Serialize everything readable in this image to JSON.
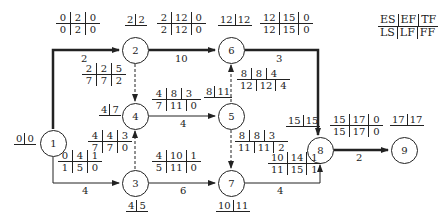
{
  "legend": {
    "top": [
      "ES",
      "EF",
      "TF"
    ],
    "bottom": [
      "LS",
      "LF",
      "FF"
    ]
  },
  "nodes": [
    {
      "id": "1",
      "label": "1",
      "et": [
        "0",
        "0"
      ]
    },
    {
      "id": "2",
      "label": "2",
      "et": [
        "2",
        "2"
      ]
    },
    {
      "id": "3",
      "label": "3",
      "et": [
        "4",
        "5"
      ]
    },
    {
      "id": "4",
      "label": "4",
      "et": [
        "4",
        "7"
      ]
    },
    {
      "id": "5",
      "label": "5",
      "et": [
        "8",
        "11"
      ]
    },
    {
      "id": "6",
      "label": "6",
      "et": [
        "12",
        "12"
      ]
    },
    {
      "id": "7",
      "label": "7",
      "et": [
        "10",
        "11"
      ]
    },
    {
      "id": "8",
      "label": "8",
      "et": [
        "15",
        "15"
      ]
    },
    {
      "id": "9",
      "label": "9",
      "et": [
        "17",
        "17"
      ]
    }
  ],
  "activities": [
    {
      "from": "1",
      "to": "2",
      "duration": "2",
      "critical": true,
      "dummy": false,
      "params": {
        "top": [
          "0",
          "2",
          "0"
        ],
        "bottom": [
          "0",
          "2",
          "0"
        ]
      }
    },
    {
      "from": "1",
      "to": "3",
      "duration": "4",
      "critical": false,
      "dummy": false,
      "params": {
        "top": [
          "0",
          "4",
          "1"
        ],
        "bottom": [
          "1",
          "5",
          "0"
        ]
      }
    },
    {
      "from": "2",
      "to": "6",
      "duration": "10",
      "critical": true,
      "dummy": false,
      "params": {
        "top": [
          "2",
          "12",
          "0"
        ],
        "bottom": [
          "2",
          "12",
          "0"
        ]
      }
    },
    {
      "from": "2",
      "to": "4",
      "duration": "",
      "critical": false,
      "dummy": true,
      "params": {
        "top": [
          "2",
          "2",
          "5"
        ],
        "bottom": [
          "7",
          "7",
          "2"
        ]
      }
    },
    {
      "from": "3",
      "to": "4",
      "duration": "",
      "critical": false,
      "dummy": true,
      "params": {
        "top": [
          "4",
          "4",
          "3"
        ],
        "bottom": [
          "7",
          "7",
          "0"
        ]
      }
    },
    {
      "from": "3",
      "to": "7",
      "duration": "6",
      "critical": false,
      "dummy": false,
      "params": {
        "top": [
          "4",
          "10",
          "1"
        ],
        "bottom": [
          "5",
          "11",
          "0"
        ]
      }
    },
    {
      "from": "4",
      "to": "5",
      "duration": "4",
      "critical": false,
      "dummy": false,
      "params": {
        "top": [
          "4",
          "8",
          "3"
        ],
        "bottom": [
          "7",
          "11",
          "0"
        ]
      }
    },
    {
      "from": "5",
      "to": "6",
      "duration": "",
      "critical": false,
      "dummy": true,
      "params": {
        "top": [
          "8",
          "8",
          "4"
        ],
        "bottom": [
          "12",
          "12",
          "4"
        ]
      }
    },
    {
      "from": "5",
      "to": "7",
      "duration": "",
      "critical": false,
      "dummy": true,
      "params": {
        "top": [
          "8",
          "8",
          "3"
        ],
        "bottom": [
          "11",
          "11",
          "2"
        ]
      }
    },
    {
      "from": "6",
      "to": "8",
      "duration": "3",
      "critical": true,
      "dummy": false,
      "params": {
        "top": [
          "12",
          "15",
          "0"
        ],
        "bottom": [
          "12",
          "15",
          "0"
        ]
      }
    },
    {
      "from": "7",
      "to": "8",
      "duration": "4",
      "critical": false,
      "dummy": false,
      "params": {
        "top": [
          "10",
          "14",
          "1"
        ],
        "bottom": [
          "11",
          "15",
          "1"
        ]
      }
    },
    {
      "from": "8",
      "to": "9",
      "duration": "2",
      "critical": true,
      "dummy": false,
      "params": {
        "top": [
          "15",
          "17",
          "0"
        ],
        "bottom": [
          "15",
          "17",
          "0"
        ]
      }
    }
  ]
}
